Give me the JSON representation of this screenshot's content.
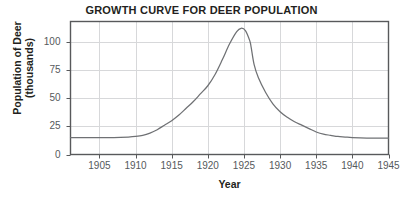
{
  "chart_data": {
    "type": "line",
    "title": "GROWTH CURVE FOR DEER POPULATION",
    "xlabel": "Year",
    "ylabel_line1": "Population of Deer",
    "ylabel_line2": "(thousands)",
    "xlim": [
      1901,
      1945
    ],
    "ylim": [
      0,
      118
    ],
    "grid": true,
    "legend": "none",
    "xticks": [
      1905,
      1910,
      1915,
      1920,
      1925,
      1930,
      1935,
      1940,
      1945
    ],
    "xtick_labels": [
      "1905",
      "1910",
      "1915",
      "1920",
      "1925",
      "1930",
      "1935",
      "1940",
      "1945"
    ],
    "yticks": [
      0,
      25,
      50,
      75,
      100
    ],
    "ytick_labels": [
      "0",
      "25",
      "50",
      "75",
      "100"
    ],
    "series": [
      {
        "name": "Deer population",
        "color": "#6f7174",
        "x": [
          1901,
          1903,
          1905,
          1907,
          1909,
          1910,
          1911,
          1912,
          1913,
          1914,
          1915,
          1916,
          1917,
          1918,
          1919,
          1920,
          1921,
          1922,
          1923,
          1924,
          1924.6,
          1925.2,
          1925.8,
          1926,
          1926.4,
          1927,
          1928,
          1929,
          1930,
          1931,
          1932,
          1933,
          1934,
          1935,
          1936,
          1937,
          1938,
          1939,
          1940,
          1942,
          1944,
          1945
        ],
        "y": [
          15,
          15,
          15,
          15,
          15.5,
          16,
          17,
          19,
          22,
          26,
          30,
          35,
          41,
          47,
          54,
          61,
          71,
          84,
          98,
          109,
          112,
          110,
          101,
          95,
          80,
          68,
          55,
          45,
          38,
          33,
          29,
          26,
          23,
          20,
          18,
          17,
          16,
          15.5,
          15,
          14.5,
          14.5,
          14.5
        ]
      }
    ]
  },
  "axes": {
    "frame_color": "#58595b",
    "grid_color": "#d7d8da",
    "tick_text_color": "#55595c"
  }
}
